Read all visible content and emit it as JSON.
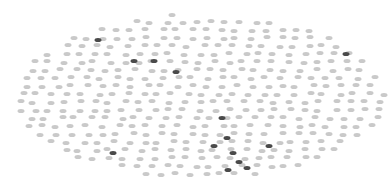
{
  "chart_data": {
    "type": "scatter",
    "title": "",
    "xlabel": "",
    "ylabel": "",
    "grid": false,
    "legend": null,
    "canvas": {
      "width": 388,
      "height": 182
    },
    "cloud": {
      "shape": "ellipse",
      "center": [
        200,
        96
      ],
      "radii": [
        186,
        82
      ],
      "spacing": 15,
      "row_spacing": 8,
      "jitter": 3,
      "color": "#c9c9c9"
    },
    "series": [
      {
        "name": "background-points",
        "color": "#c9c9c9",
        "generated": true
      },
      {
        "name": "highlighted-points",
        "color": "#4a4a4a",
        "points": [
          [
            98,
            40
          ],
          [
            134,
            61
          ],
          [
            154,
            61
          ],
          [
            176,
            72
          ],
          [
            346,
            54
          ],
          [
            113,
            153
          ],
          [
            222,
            118
          ],
          [
            214,
            146
          ],
          [
            227,
            138
          ],
          [
            233,
            153
          ],
          [
            239,
            162
          ],
          [
            228,
            170
          ],
          [
            247,
            168
          ],
          [
            269,
            146
          ]
        ]
      }
    ]
  }
}
